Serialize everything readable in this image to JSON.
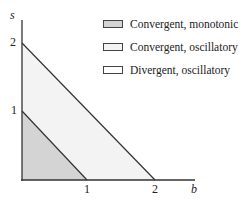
{
  "diagram": {
    "axes": {
      "x_label": "b",
      "y_label": "s",
      "x_ticks": [
        "1",
        "2"
      ],
      "y_ticks": [
        "1",
        "2"
      ]
    },
    "regions": [
      {
        "name": "Convergent, monotonic",
        "vertices": [
          [
            0,
            0
          ],
          [
            1,
            0
          ],
          [
            0,
            1
          ]
        ],
        "fill": "#d4d4d4"
      },
      {
        "name": "Convergent, oscillatory",
        "vertices": [
          [
            1,
            0
          ],
          [
            2,
            0
          ],
          [
            0,
            2
          ],
          [
            0,
            1
          ]
        ],
        "fill": "#f3f3f3"
      },
      {
        "name": "Divergent, oscillatory",
        "description": "region outside b + s = 2",
        "fill": "#ffffff"
      }
    ],
    "lines": [
      {
        "equation": "b + s = 1",
        "from": [
          0,
          1
        ],
        "to": [
          1,
          0
        ]
      },
      {
        "equation": "b + s = 2",
        "from": [
          0,
          2
        ],
        "to": [
          2,
          0
        ]
      }
    ]
  },
  "legend": [
    {
      "label": "Convergent, monotonic",
      "color": "#d4d4d4"
    },
    {
      "label": "Convergent, oscillatory",
      "color": "#f3f3f3"
    },
    {
      "label": "Divergent, oscillatory",
      "color": "#ffffff"
    }
  ]
}
